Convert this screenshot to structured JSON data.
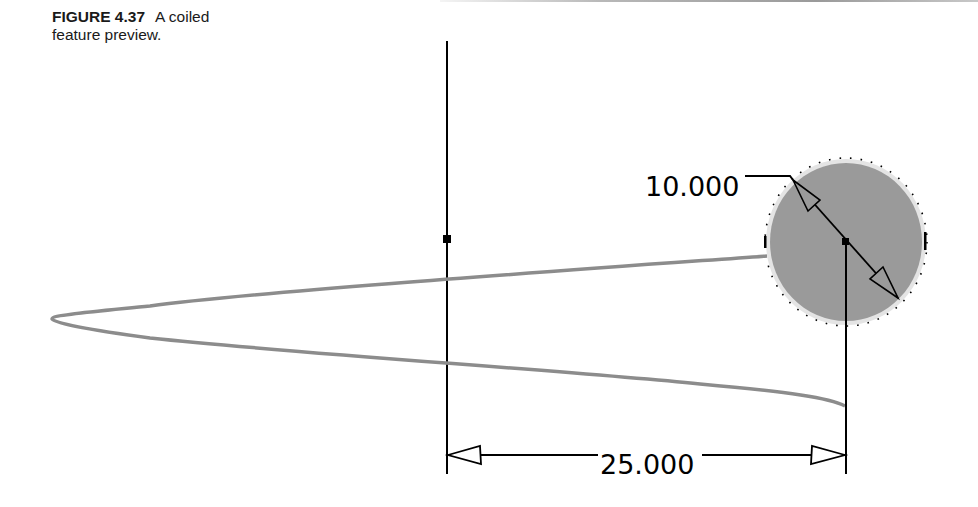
{
  "caption": {
    "figure_number": "FIGURE 4.37",
    "line1": "A coiled",
    "line2": "feature preview."
  },
  "drawing": {
    "profile_diameter_label": "10.000",
    "pitch_dimension_label": "25.000",
    "colors": {
      "profile_fill": "#9a9a9a",
      "sweep_path": "#8c8c8c",
      "lines": "#000000",
      "background": "#ffffff"
    }
  }
}
